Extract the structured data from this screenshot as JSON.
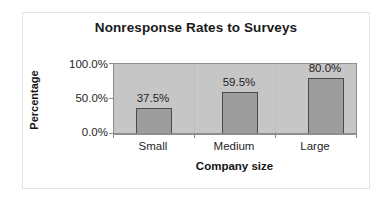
{
  "chart_data": {
    "type": "bar",
    "title": "Nonresponse Rates to Surveys",
    "xlabel": "Company size",
    "ylabel": "Percentage",
    "categories": [
      "Small",
      "Medium",
      "Large"
    ],
    "values": [
      37.5,
      59.5,
      80.0
    ],
    "value_labels": [
      "37.5%",
      "59.5%",
      "80.0%"
    ],
    "ytick_labels": [
      "100.0%",
      "50.0%",
      "0.0%"
    ],
    "ytick_values": [
      100.0,
      50.0,
      0.0
    ],
    "ylim": [
      0,
      100
    ],
    "yunit": "%",
    "grid": false,
    "legend": "none",
    "series": [
      {
        "name": "Nonresponse rate",
        "values": [
          37.5,
          59.5,
          80.0
        ]
      }
    ],
    "colors": {
      "bar_fill": "#9d9d9d",
      "bar_border": "#4a4a4a",
      "plot_background": "#c6c6c6",
      "axis_line": "#8e8e8e",
      "text": "#1f1f1f",
      "canvas_background": "#ffffff",
      "frame_border": "#e3e3e3"
    }
  }
}
